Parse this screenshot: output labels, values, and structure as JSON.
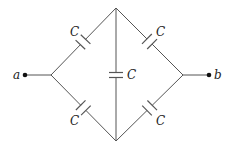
{
  "diagram": {
    "title": "",
    "type": "capacitor-bridge-circuit",
    "terminals": [
      {
        "id": "a",
        "label": "a"
      },
      {
        "id": "b",
        "label": "b"
      }
    ],
    "capacitors": [
      {
        "id": "top-left",
        "label": "C"
      },
      {
        "id": "top-right",
        "label": "C"
      },
      {
        "id": "middle",
        "label": "C"
      },
      {
        "id": "bottom-left",
        "label": "C"
      },
      {
        "id": "bottom-right",
        "label": "C"
      }
    ],
    "colors": {
      "wire": "#555555",
      "text": "#222222",
      "background": "#ffffff"
    }
  }
}
